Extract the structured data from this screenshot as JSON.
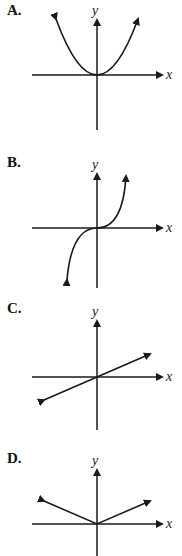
{
  "options": [
    {
      "label": "A.",
      "graph": "parabola (y = x^2), opening upward, vertex at origin"
    },
    {
      "label": "B.",
      "graph": "cubic (y = x^3), increasing through origin"
    },
    {
      "label": "C.",
      "graph": "line through origin with positive slope"
    },
    {
      "label": "D.",
      "graph": "absolute value (y = |x|), V shape with vertex at origin"
    }
  ],
  "axes": {
    "x_label": "x",
    "y_label": "y"
  },
  "colors": {
    "stroke": "#1a1a1a",
    "background": "#ffffff"
  }
}
